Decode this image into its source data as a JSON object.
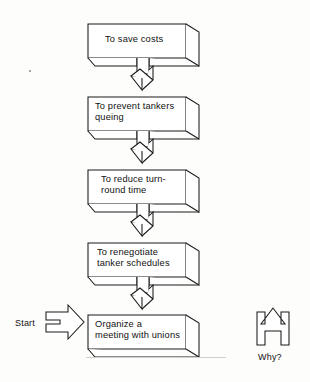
{
  "diagram": {
    "type": "why-why-ladder-flowchart",
    "orientation": "vertical",
    "background_color": "#fdfdfb",
    "line_color": "#1a1a1a",
    "steps": [
      {
        "id": "step-1",
        "lines": [
          "To save costs"
        ],
        "text": "To save costs"
      },
      {
        "id": "step-2",
        "lines": [
          "To prevent tankers",
          "queing"
        ],
        "text": "To prevent tankers queing"
      },
      {
        "id": "step-3",
        "lines": [
          "To reduce turn-",
          "round time"
        ],
        "text": "To reduce turn-round time"
      },
      {
        "id": "step-4",
        "lines": [
          "To renegotiate",
          "tanker schedules"
        ],
        "text": "To renegotiate tanker schedules"
      },
      {
        "id": "step-5",
        "lines": [
          "Organize a",
          "meeting with unions"
        ],
        "text": "Organize a meeting with unions"
      }
    ],
    "connectors": [
      {
        "id": "connector-1",
        "from": "step-1",
        "to": "step-2",
        "icon": "down-arrow-3d"
      },
      {
        "id": "connector-2",
        "from": "step-2",
        "to": "step-3",
        "icon": "down-arrow-3d"
      },
      {
        "id": "connector-3",
        "from": "step-3",
        "to": "step-4",
        "icon": "down-arrow-3d"
      },
      {
        "id": "connector-4",
        "from": "step-4",
        "to": "step-5",
        "icon": "down-arrow-3d"
      }
    ],
    "start_marker": {
      "label": "Start",
      "icon": "right-arrow-icon",
      "position": "left-of-bottom-box"
    },
    "direction_marker": {
      "label": "Why?",
      "icon": "up-arrow-icon",
      "position": "right-side"
    }
  }
}
